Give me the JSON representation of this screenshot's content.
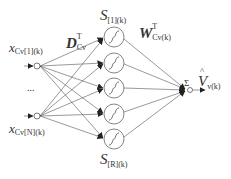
{
  "diagram": {
    "type": "rbf-neural-network",
    "inputs": [
      {
        "id": "x1",
        "label_main": "x",
        "label_sub": "Cv[1](k)",
        "y": 66
      },
      {
        "id": "xN",
        "label_main": "x",
        "label_sub": "Cv[N](k)",
        "y": 116
      }
    ],
    "ellipsis": "...",
    "hidden_neurons": {
      "count": 5,
      "centers_y": [
        37,
        63,
        88,
        114,
        139
      ],
      "x": 114,
      "radius": 10,
      "top_label_main": "S",
      "top_label_sub": "[1](k)",
      "bottom_label_main": "S",
      "bottom_label_sub": "[R](k)"
    },
    "input_weights_label": {
      "main": "D",
      "sup": "T",
      "sub": "Cv"
    },
    "output_weights_label": {
      "main": "W",
      "sup": "T",
      "sub": "Cv(k)"
    },
    "output": {
      "sum_symbol": "Σ",
      "label_main": "V",
      "label_hat": "^",
      "label_sub": "v(k)"
    },
    "colors": {
      "line": "#555555",
      "text": "#333333",
      "background": "#ffffff"
    }
  }
}
